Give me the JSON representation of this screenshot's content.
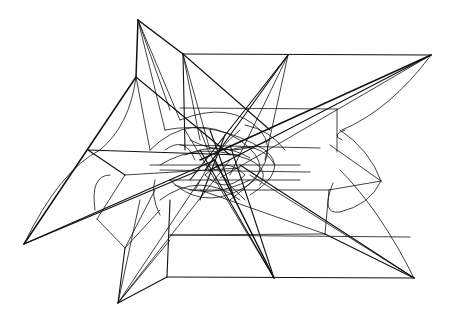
{
  "artwork": {
    "description": "Abstract black-and-white plotter line drawing: a star-like wireframe of straight lines and curves radiating from a dense central tangle",
    "background_color": "#ffffff",
    "line_color": "#111111",
    "vertices": {
      "top_apex": [
        138,
        20
      ],
      "upper_right_corner": [
        183,
        54
      ],
      "top_mid_apex": [
        288,
        55
      ],
      "far_right_apex": [
        431,
        55
      ],
      "upper_left_vertex": [
        136,
        77
      ],
      "left_mid_vertex": [
        88,
        150
      ],
      "far_left_apex": [
        24,
        244
      ],
      "left_lower_vertex": [
        97,
        219
      ],
      "inner_left_vertex": [
        125,
        248
      ],
      "bottom_left_apex": [
        118,
        303
      ],
      "bottom_box_corner": [
        167,
        277
      ],
      "bottom_mid_apex": [
        274,
        278
      ],
      "bottom_right_apex": [
        414,
        278
      ],
      "right_apex": [
        381,
        181
      ],
      "right_box_top": [
        337,
        109
      ],
      "right_box_corner": [
        329,
        190
      ],
      "right_lower_vertex": [
        325,
        234
      ],
      "center": [
        215,
        165
      ]
    }
  }
}
